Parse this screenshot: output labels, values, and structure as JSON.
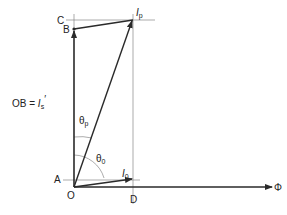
{
  "diagram": {
    "type": "phasor-diagram",
    "points": {
      "C": "C",
      "B": "B",
      "A": "A",
      "O": "O",
      "D": "D"
    },
    "labels": {
      "Ip_main": "I",
      "Ip_sub": "p",
      "I0_main": "I",
      "I0_sub": "0",
      "theta_p_main": "θ",
      "theta_p_sub": "p",
      "theta_0_main": "θ",
      "theta_0_sub": "0",
      "flux": "Φ",
      "ob_eq_prefix": "OB = ",
      "ob_eq_main": "I",
      "ob_eq_sub": "s",
      "ob_eq_prime": "′"
    },
    "colors": {
      "line": "#2a2a2a",
      "guide": "#888888",
      "text": "#222222"
    }
  }
}
